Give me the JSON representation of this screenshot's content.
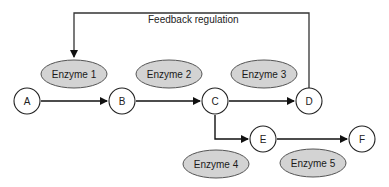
{
  "diagram": {
    "feedback_label": "Feedback regulation",
    "colors": {
      "line": "#111111",
      "enzyme_fill": "#d3d3d3",
      "enzyme_stroke": "#555555",
      "node_fill": "#ffffff",
      "node_stroke": "#222222"
    },
    "nodes": [
      {
        "id": "A",
        "label": "A"
      },
      {
        "id": "B",
        "label": "B"
      },
      {
        "id": "C",
        "label": "C"
      },
      {
        "id": "D",
        "label": "D"
      },
      {
        "id": "E",
        "label": "E"
      },
      {
        "id": "F",
        "label": "F"
      }
    ],
    "enzymes": [
      {
        "id": "enzyme-1",
        "label": "Enzyme 1",
        "catalyzes": "A→B"
      },
      {
        "id": "enzyme-2",
        "label": "Enzyme 2",
        "catalyzes": "B→C"
      },
      {
        "id": "enzyme-3",
        "label": "Enzyme 3",
        "catalyzes": "C→D"
      },
      {
        "id": "enzyme-4",
        "label": "Enzyme 4",
        "catalyzes": "C→E"
      },
      {
        "id": "enzyme-5",
        "label": "Enzyme 5",
        "catalyzes": "E→F"
      }
    ],
    "edges": [
      {
        "from": "A",
        "to": "B"
      },
      {
        "from": "B",
        "to": "C"
      },
      {
        "from": "C",
        "to": "D"
      },
      {
        "from": "C",
        "to": "E"
      },
      {
        "from": "E",
        "to": "F"
      },
      {
        "from": "D",
        "to": "enzyme-1",
        "type": "feedback"
      }
    ]
  }
}
